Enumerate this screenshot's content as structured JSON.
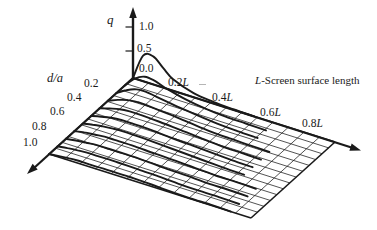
{
  "figure": {
    "background": "#ffffff",
    "ink_color": "#1a1a1a"
  },
  "q_axis": {
    "label": "q",
    "ticks": [
      "1.0",
      "0.5",
      "0.0"
    ]
  },
  "da_axis": {
    "label": "d/a",
    "ticks": [
      "0.2",
      "0.4",
      "0.6",
      "0.8",
      "1.0"
    ]
  },
  "l_axis": {
    "title_italic": "L",
    "title_rest": "-Screen surface length",
    "ticks": [
      {
        "value": "0.2",
        "unit": "L"
      },
      {
        "value": "0.4",
        "unit": "L"
      },
      {
        "value": "0.6",
        "unit": "L"
      },
      {
        "value": "0.8",
        "unit": "L"
      }
    ]
  },
  "chart_data": {
    "type": "line",
    "subtype": "3d-wireframe-surface-profiles",
    "title": "",
    "x_axis": {
      "label": "L-Screen surface length",
      "range": [
        0,
        1
      ],
      "tick_labels": [
        "0.2L",
        "0.4L",
        "0.6L",
        "0.8L"
      ]
    },
    "y_axis": {
      "label": "d/a",
      "range": [
        0,
        1
      ],
      "tick_labels": [
        "0.2",
        "0.4",
        "0.6",
        "0.8",
        "1.0"
      ]
    },
    "z_axis": {
      "label": "q",
      "range": [
        0,
        1.3
      ],
      "tick_labels": [
        "0.0",
        "0.5",
        "1.0"
      ]
    },
    "grid_divisions": 13,
    "legend": "none",
    "l_points": [
      0,
      0.05,
      0.1,
      0.15,
      0.2,
      0.3,
      0.4,
      0.5,
      0.6,
      0.7,
      0.8,
      0.9,
      1.0
    ],
    "profiles": [
      {
        "da": 0.0,
        "q": [
          0,
          0.5,
          0.55,
          0.38,
          0.22,
          0.08,
          0.03,
          0.01,
          0,
          0,
          0,
          0,
          0
        ]
      },
      {
        "da": 0.1,
        "q": [
          0,
          0.2,
          0.3,
          0.28,
          0.21,
          0.11,
          0.05,
          0.02,
          0.01,
          0,
          0,
          0,
          0
        ]
      },
      {
        "da": 0.2,
        "q": [
          0,
          0.12,
          0.2,
          0.21,
          0.18,
          0.12,
          0.07,
          0.03,
          0.01,
          0,
          0,
          0,
          0
        ]
      },
      {
        "da": 0.3,
        "q": [
          0,
          0.08,
          0.14,
          0.16,
          0.15,
          0.12,
          0.08,
          0.04,
          0.02,
          0.01,
          0,
          0,
          0
        ]
      },
      {
        "da": 0.4,
        "q": [
          0,
          0.06,
          0.11,
          0.13,
          0.13,
          0.11,
          0.08,
          0.05,
          0.02,
          0.01,
          0,
          0,
          0
        ]
      },
      {
        "da": 0.5,
        "q": [
          0,
          0.05,
          0.09,
          0.11,
          0.11,
          0.1,
          0.07,
          0.05,
          0.03,
          0.01,
          0,
          0,
          0
        ]
      },
      {
        "da": 0.6,
        "q": [
          0,
          0.04,
          0.07,
          0.09,
          0.1,
          0.09,
          0.07,
          0.05,
          0.03,
          0.01,
          0,
          0,
          0
        ]
      },
      {
        "da": 0.7,
        "q": [
          0,
          0.04,
          0.06,
          0.08,
          0.08,
          0.08,
          0.06,
          0.05,
          0.03,
          0.01,
          0.01,
          0,
          0
        ]
      },
      {
        "da": 0.8,
        "q": [
          0,
          0.03,
          0.05,
          0.07,
          0.07,
          0.07,
          0.06,
          0.04,
          0.03,
          0.01,
          0.01,
          0,
          0
        ]
      },
      {
        "da": 0.9,
        "q": [
          0,
          0.03,
          0.05,
          0.06,
          0.06,
          0.06,
          0.05,
          0.04,
          0.02,
          0.01,
          0.01,
          0,
          0
        ]
      },
      {
        "da": 1.0,
        "q": [
          0,
          0.02,
          0.04,
          0.05,
          0.05,
          0.05,
          0.05,
          0.04,
          0.02,
          0.01,
          0.01,
          0,
          0
        ]
      }
    ]
  }
}
